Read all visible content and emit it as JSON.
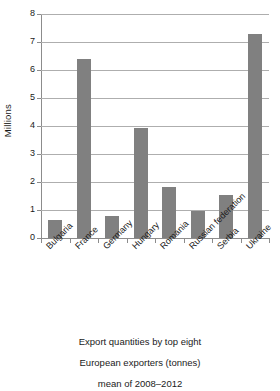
{
  "chart_data": {
    "type": "bar",
    "title": "",
    "categories": [
      "Bulgaria",
      "France",
      "Germany",
      "Hungary",
      "Romania",
      "Russian federation",
      "Serbia",
      "Ukraine"
    ],
    "values": [
      0.65,
      6.4,
      0.78,
      3.92,
      1.82,
      0.97,
      1.55,
      7.3
    ],
    "xlabel": "",
    "ylabel": "Millions",
    "ylim": [
      0,
      8
    ],
    "ytick_labels": [
      "0",
      "1",
      "2",
      "3",
      "4",
      "5",
      "6",
      "7",
      "8"
    ],
    "ytick_values": [
      0,
      1,
      2,
      3,
      4,
      5,
      6,
      7,
      8
    ],
    "grid": true,
    "legend": false,
    "bar_color": "#808080",
    "grid_color": "#aeaeae",
    "axis_color": "#8c8c8c",
    "caption_lines": [
      "Export quantities by top eight",
      "European exporters (tonnes)",
      "mean of 2008–2012"
    ]
  }
}
